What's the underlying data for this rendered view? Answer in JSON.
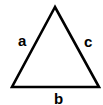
{
  "diagram": {
    "type": "triangle",
    "vertices": {
      "apex": [
        55,
        7
      ],
      "bottom_left": [
        12,
        87
      ],
      "bottom_right": [
        99,
        87
      ]
    },
    "labels": {
      "left_side": "a",
      "bottom_side": "b",
      "right_side": "c"
    },
    "stroke_color": "#000000",
    "background": "#ffffff"
  }
}
